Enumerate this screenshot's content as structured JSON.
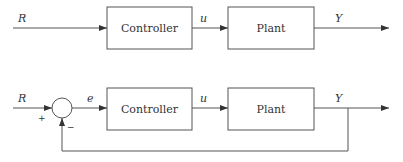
{
  "diagrams": [
    {
      "name": "open-loop",
      "input_label": "R",
      "blocks": [
        {
          "label": "Controller"
        },
        {
          "label": "Plant"
        }
      ],
      "signal_u": "u",
      "output_label": "Y"
    },
    {
      "name": "closed-loop",
      "input_label": "R",
      "sum_plus": "+",
      "sum_minus": "−",
      "error_label": "e",
      "blocks": [
        {
          "label": "Controller"
        },
        {
          "label": "Plant"
        }
      ],
      "signal_u": "u",
      "output_label": "Y"
    }
  ],
  "colors": {
    "line": "#555555",
    "text": "#333333"
  }
}
